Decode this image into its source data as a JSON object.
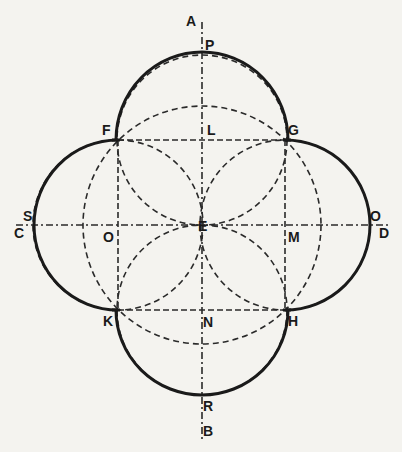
{
  "diagram": {
    "type": "geometric-construction",
    "center": {
      "name": "E",
      "x": 202,
      "y": 225
    },
    "points": {
      "A": {
        "label": "A",
        "x": 202,
        "y": 18
      },
      "P": {
        "label": "P",
        "x": 202,
        "y": 52
      },
      "F": {
        "label": "F",
        "x": 118,
        "y": 140
      },
      "L": {
        "label": "L",
        "x": 202,
        "y": 140
      },
      "G": {
        "label": "G",
        "x": 285,
        "y": 140
      },
      "S": {
        "label": "S",
        "x": 34,
        "y": 225
      },
      "C": {
        "label": "C",
        "x": 20,
        "y": 225
      },
      "O_left": {
        "label": "O",
        "x": 118,
        "y": 225
      },
      "E": {
        "label": "E",
        "x": 202,
        "y": 225
      },
      "M": {
        "label": "M",
        "x": 285,
        "y": 225
      },
      "O_right": {
        "label": "O",
        "x": 370,
        "y": 225
      },
      "D": {
        "label": "D",
        "x": 382,
        "y": 225
      },
      "K": {
        "label": "K",
        "x": 118,
        "y": 310
      },
      "N": {
        "label": "N",
        "x": 202,
        "y": 310
      },
      "H": {
        "label": "H",
        "x": 285,
        "y": 310
      },
      "R": {
        "label": "R",
        "x": 202,
        "y": 395
      },
      "B": {
        "label": "B",
        "x": 202,
        "y": 432
      }
    },
    "labels": {
      "A": "A",
      "P": "P",
      "F": "F",
      "L": "L",
      "G": "G",
      "S": "S",
      "C": "C",
      "O_left": "O",
      "E": "E",
      "M": "M",
      "O_right": "O",
      "D": "D",
      "K": "K",
      "N": "N",
      "H": "H",
      "R": "R",
      "B": "B"
    },
    "large_circle": {
      "center": "E",
      "radius": 119,
      "style": "dashed"
    },
    "small_circles": [
      {
        "center": "L",
        "radius": 85,
        "style": "dashed"
      },
      {
        "center": "M",
        "radius": 85,
        "style": "dashed"
      },
      {
        "center": "N",
        "radius": 85,
        "style": "dashed"
      },
      {
        "center": "O_left",
        "radius": 85,
        "style": "dashed"
      }
    ],
    "bold_arcs": [
      {
        "center": "L",
        "from": "F",
        "to": "G",
        "through": "P"
      },
      {
        "center": "M",
        "from": "G",
        "to": "H",
        "through": "O_right"
      },
      {
        "center": "N",
        "from": "H",
        "to": "K",
        "through": "R"
      },
      {
        "center": "O_left",
        "from": "K",
        "to": "F",
        "through": "S"
      }
    ],
    "lines": [
      {
        "from": "A",
        "to": "B",
        "style": "dash-dot",
        "role": "vertical axis"
      },
      {
        "from": "C",
        "to": "D",
        "style": "dash-dot",
        "role": "horizontal axis"
      },
      {
        "from": "F",
        "to": "G",
        "style": "dashed"
      },
      {
        "from": "K",
        "to": "H",
        "style": "dashed"
      },
      {
        "from": "F",
        "to": "K",
        "style": "dashed"
      },
      {
        "from": "G",
        "to": "H",
        "style": "dashed"
      },
      {
        "from": "F",
        "to": "H",
        "style": "dashed",
        "role": "diagonal"
      },
      {
        "from": "G",
        "to": "K",
        "style": "dashed",
        "role": "diagonal"
      }
    ]
  }
}
